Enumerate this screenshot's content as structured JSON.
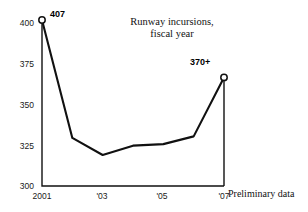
{
  "chart_data": {
    "type": "line",
    "title": "Runway incursions, fiscal year",
    "title_line1": "Runway incursions,",
    "title_line2": "fiscal year",
    "xlabel": "",
    "ylabel": "",
    "categories": [
      "2001",
      "2002",
      "2003",
      "2004",
      "2005",
      "2006",
      "2007"
    ],
    "x_tick_labels": [
      "2001",
      "'03",
      "'05",
      "'07"
    ],
    "x_tick_values": [
      2001,
      2003,
      2005,
      2007
    ],
    "y_tick_labels": [
      "300",
      "325",
      "350",
      "375",
      "400"
    ],
    "y_tick_values": [
      300,
      325,
      350,
      375,
      400
    ],
    "ylim": [
      300,
      407
    ],
    "xlim": [
      2001,
      2007
    ],
    "grid": false,
    "legend": false,
    "series": [
      {
        "name": "Runway incursions",
        "x": [
          2001,
          2002,
          2003,
          2004,
          2005,
          2006,
          2007
        ],
        "values": [
          407,
          331,
          320,
          326,
          327,
          332,
          370
        ]
      }
    ],
    "annotations": [
      {
        "name": "first-point-label",
        "text": "407",
        "x": 2001,
        "y": 407,
        "marker": "open-circle"
      },
      {
        "name": "last-point-label",
        "text": "370+",
        "x": 2007,
        "y": 370,
        "marker": "open-circle"
      }
    ],
    "footnote": "Preliminary data",
    "line_color": "#111111",
    "marker_fill": "#ffffff",
    "axis_color": "#111111"
  }
}
